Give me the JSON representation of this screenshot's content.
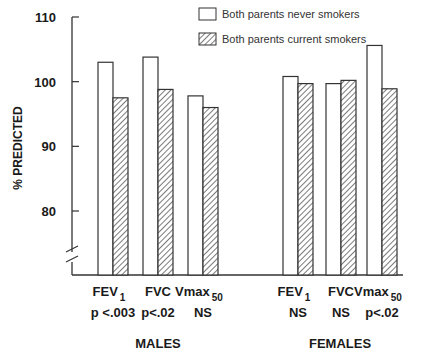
{
  "chart_data": {
    "type": "bar",
    "title": "",
    "xlabel": "",
    "ylabel": "% PREDICTED",
    "ylim": [
      75,
      110
    ],
    "yticks": [
      80,
      90,
      100,
      110
    ],
    "axis_break": true,
    "grid": false,
    "legend_position": "top-right",
    "groups": [
      {
        "name": "MALES",
        "categories": [
          {
            "label": "FEV",
            "subscript": "1",
            "pvalue": "p <.003"
          },
          {
            "label": "FVC",
            "subscript": "",
            "pvalue": "p<.02"
          },
          {
            "label": "Vmax",
            "subscript": "50",
            "pvalue": "NS"
          }
        ]
      },
      {
        "name": "FEMALES",
        "categories": [
          {
            "label": "FEV",
            "subscript": "1",
            "pvalue": "NS"
          },
          {
            "label": "FVC",
            "subscript": "",
            "pvalue": "NS"
          },
          {
            "label": "Vmax",
            "subscript": "50",
            "pvalue": "p<.02"
          }
        ]
      }
    ],
    "series": [
      {
        "name": "Both parents never smokers",
        "pattern": "open",
        "values": [
          103.0,
          103.8,
          97.8,
          100.8,
          99.7,
          105.6
        ]
      },
      {
        "name": "Both parents current smokers",
        "pattern": "hatched",
        "values": [
          97.5,
          98.8,
          96.0,
          99.7,
          100.2,
          98.9
        ]
      }
    ]
  }
}
